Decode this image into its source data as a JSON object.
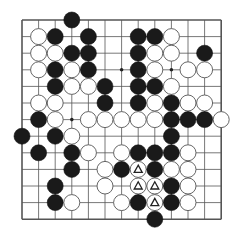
{
  "board": {
    "size": 13,
    "origin_x": 22,
    "origin_y": 20,
    "spacing": 16.6,
    "stone_radius": 8,
    "line_color": "#555555",
    "black_color": "#1a1a1a",
    "white_color": "#ffffff",
    "star_points": [
      [
        6,
        3
      ],
      [
        9,
        3
      ],
      [
        3,
        6
      ]
    ],
    "stones": [
      {
        "c": 3,
        "r": 0,
        "color": "B"
      },
      {
        "c": 1,
        "r": 1,
        "color": "W"
      },
      {
        "c": 2,
        "r": 1,
        "color": "B"
      },
      {
        "c": 4,
        "r": 1,
        "color": "B"
      },
      {
        "c": 7,
        "r": 1,
        "color": "B"
      },
      {
        "c": 8,
        "r": 1,
        "color": "B"
      },
      {
        "c": 9,
        "r": 1,
        "color": "W"
      },
      {
        "c": 1,
        "r": 2,
        "color": "W"
      },
      {
        "c": 2,
        "r": 2,
        "color": "W"
      },
      {
        "c": 3,
        "r": 2,
        "color": "B"
      },
      {
        "c": 4,
        "r": 2,
        "color": "B"
      },
      {
        "c": 7,
        "r": 2,
        "color": "B"
      },
      {
        "c": 8,
        "r": 2,
        "color": "W"
      },
      {
        "c": 9,
        "r": 2,
        "color": "W"
      },
      {
        "c": 11,
        "r": 2,
        "color": "B"
      },
      {
        "c": 1,
        "r": 3,
        "color": "W"
      },
      {
        "c": 2,
        "r": 3,
        "color": "B"
      },
      {
        "c": 3,
        "r": 3,
        "color": "W"
      },
      {
        "c": 4,
        "r": 3,
        "color": "B"
      },
      {
        "c": 7,
        "r": 3,
        "color": "B"
      },
      {
        "c": 8,
        "r": 3,
        "color": "W"
      },
      {
        "c": 10,
        "r": 3,
        "color": "W"
      },
      {
        "c": 11,
        "r": 3,
        "color": "W"
      },
      {
        "c": 2,
        "r": 4,
        "color": "B"
      },
      {
        "c": 3,
        "r": 4,
        "color": "W"
      },
      {
        "c": 4,
        "r": 4,
        "color": "W"
      },
      {
        "c": 5,
        "r": 4,
        "color": "B"
      },
      {
        "c": 7,
        "r": 4,
        "color": "B"
      },
      {
        "c": 8,
        "r": 4,
        "color": "B"
      },
      {
        "c": 9,
        "r": 4,
        "color": "W"
      },
      {
        "c": 1,
        "r": 5,
        "color": "W"
      },
      {
        "c": 2,
        "r": 5,
        "color": "W"
      },
      {
        "c": 5,
        "r": 5,
        "color": "B"
      },
      {
        "c": 7,
        "r": 5,
        "color": "B"
      },
      {
        "c": 8,
        "r": 5,
        "color": "W"
      },
      {
        "c": 9,
        "r": 5,
        "color": "B"
      },
      {
        "c": 10,
        "r": 5,
        "color": "W"
      },
      {
        "c": 11,
        "r": 5,
        "color": "W"
      },
      {
        "c": 1,
        "r": 6,
        "color": "B"
      },
      {
        "c": 2,
        "r": 6,
        "color": "W"
      },
      {
        "c": 4,
        "r": 6,
        "color": "W"
      },
      {
        "c": 5,
        "r": 6,
        "color": "W"
      },
      {
        "c": 6,
        "r": 6,
        "color": "W"
      },
      {
        "c": 7,
        "r": 6,
        "color": "W"
      },
      {
        "c": 8,
        "r": 6,
        "color": "W"
      },
      {
        "c": 9,
        "r": 6,
        "color": "B"
      },
      {
        "c": 10,
        "r": 6,
        "color": "B"
      },
      {
        "c": 11,
        "r": 6,
        "color": "B"
      },
      {
        "c": 12,
        "r": 6,
        "color": "W"
      },
      {
        "c": 0,
        "r": 7,
        "color": "B"
      },
      {
        "c": 2,
        "r": 7,
        "color": "B"
      },
      {
        "c": 3,
        "r": 7,
        "color": "W"
      },
      {
        "c": 9,
        "r": 7,
        "color": "B"
      },
      {
        "c": 1,
        "r": 8,
        "color": "B"
      },
      {
        "c": 3,
        "r": 8,
        "color": "B"
      },
      {
        "c": 4,
        "r": 8,
        "color": "W"
      },
      {
        "c": 6,
        "r": 8,
        "color": "W"
      },
      {
        "c": 7,
        "r": 8,
        "color": "B"
      },
      {
        "c": 8,
        "r": 8,
        "color": "B"
      },
      {
        "c": 9,
        "r": 8,
        "color": "B"
      },
      {
        "c": 10,
        "r": 8,
        "color": "W"
      },
      {
        "c": 3,
        "r": 9,
        "color": "B"
      },
      {
        "c": 5,
        "r": 9,
        "color": "W"
      },
      {
        "c": 6,
        "r": 9,
        "color": "B"
      },
      {
        "c": 7,
        "r": 9,
        "color": "W",
        "mark": "triangle"
      },
      {
        "c": 8,
        "r": 9,
        "color": "B"
      },
      {
        "c": 9,
        "r": 9,
        "color": "W"
      },
      {
        "c": 10,
        "r": 9,
        "color": "W"
      },
      {
        "c": 2,
        "r": 10,
        "color": "B"
      },
      {
        "c": 5,
        "r": 10,
        "color": "W"
      },
      {
        "c": 7,
        "r": 10,
        "color": "W",
        "mark": "triangle"
      },
      {
        "c": 8,
        "r": 10,
        "color": "W",
        "mark": "triangle"
      },
      {
        "c": 9,
        "r": 10,
        "color": "B"
      },
      {
        "c": 10,
        "r": 10,
        "color": "W"
      },
      {
        "c": 2,
        "r": 11,
        "color": "B"
      },
      {
        "c": 3,
        "r": 11,
        "color": "W"
      },
      {
        "c": 6,
        "r": 11,
        "color": "W"
      },
      {
        "c": 7,
        "r": 11,
        "color": "B"
      },
      {
        "c": 8,
        "r": 11,
        "color": "W",
        "mark": "triangle"
      },
      {
        "c": 9,
        "r": 11,
        "color": "B"
      },
      {
        "c": 10,
        "r": 11,
        "color": "W"
      },
      {
        "c": 8,
        "r": 12,
        "color": "B"
      }
    ]
  }
}
